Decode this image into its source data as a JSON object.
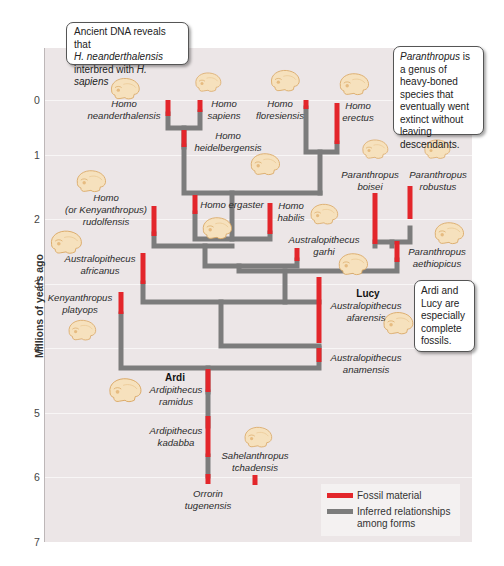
{
  "axis": {
    "label": "Millions of years ago",
    "ticks": [
      "0",
      "1",
      "2",
      "3",
      "4",
      "5",
      "6",
      "7"
    ],
    "range": [
      0,
      7
    ]
  },
  "callouts": {
    "neanderthal": {
      "line1": "Ancient DNA reveals that",
      "line2_italic": "H. neanderthalensis",
      "line3_text": "interbred with ",
      "line3_italic": "H. sapiens"
    },
    "paranthropus": {
      "italic": "Paranthropus",
      "text": " is a genus of heavy-boned species that eventually went extinct without leaving descendants."
    },
    "ardi_lucy": {
      "text": "Ardi and Lucy are especially complete fossils."
    }
  },
  "species": {
    "neanderthalensis": {
      "genus": "Homo",
      "species": "neanderthalensis"
    },
    "sapiens": {
      "genus": "Homo",
      "species": "sapiens"
    },
    "floresiensis": {
      "genus": "Homo",
      "species": "floresiensis"
    },
    "erectus": {
      "genus": "Homo",
      "species": "erectus"
    },
    "heidelbergensis": {
      "genus": "Homo",
      "species": "heidelbergensis"
    },
    "rudolfensis": {
      "genus": "Homo",
      "alt": "(or Kenyanthropus)",
      "species": "rudolfensis"
    },
    "ergaster": {
      "full": "Homo ergaster"
    },
    "habilis": {
      "genus": "Homo",
      "species": "habilis"
    },
    "boisei": {
      "genus": "Paranthropus",
      "species": "boisei"
    },
    "robustus": {
      "genus": "Paranthropus",
      "species": "robustus"
    },
    "africanus": {
      "genus": "Australopithecus",
      "species": "africanus"
    },
    "garhi": {
      "genus": "Australopithecus",
      "species": "garhi"
    },
    "aethiopicus": {
      "genus": "Paranthropus",
      "species": "aethiopicus"
    },
    "platyops": {
      "genus": "Kenyanthropus",
      "species": "platyops"
    },
    "afarensis": {
      "nickname": "Lucy",
      "genus": "Australopithecus",
      "species": "afarensis"
    },
    "anamensis": {
      "genus": "Australopithecus",
      "species": "anamensis"
    },
    "ramidus": {
      "nickname": "Ardi",
      "genus": "Ardipithecus",
      "species": "ramidus"
    },
    "kadabba": {
      "genus": "Ardipithecus",
      "species": "kadabba"
    },
    "tchadensis": {
      "genus": "Sahelanthropus",
      "species": "tchadensis"
    },
    "tugenensis": {
      "genus": "Orrorin",
      "species": "tugenensis"
    }
  },
  "legend": {
    "fossil": {
      "label": "Fossil material",
      "color": "#e3262b"
    },
    "inferred": {
      "label": "Inferred relationships among forms",
      "line1": "Inferred relationships",
      "line2": "among forms",
      "color": "#7c7c7c"
    }
  },
  "colors": {
    "panel": "#ece6e7",
    "fossil": "#e3262b",
    "inferred": "#7c7c7c",
    "skull": "#f6e1bd",
    "skull_outline": "#d9a661"
  }
}
